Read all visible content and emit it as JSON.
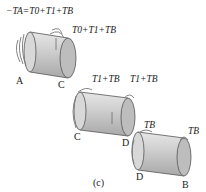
{
  "figure": {
    "caption": "(c)",
    "segments": [
      {
        "name": "AC",
        "left_label": "A",
        "right_label": "C",
        "left_torque": "−T_A=T_0+T_1+T_B",
        "left_torque_text": "−TA=T0+T1+TB",
        "right_torque_text": "T0+T1+TB"
      },
      {
        "name": "CD",
        "left_label": "C",
        "right_label": "D",
        "left_torque_text": "T1+TB",
        "right_torque_text": "T1+TB"
      },
      {
        "name": "DB",
        "left_label": "D",
        "right_label": "B",
        "left_torque_text": "TB",
        "right_torque_text": "TB"
      }
    ],
    "colors": {
      "shaft_fill": "#c9c9c9",
      "shaft_end": "#b5b5b5",
      "shaft_edge": "#555555",
      "arrow": "#777777"
    }
  }
}
